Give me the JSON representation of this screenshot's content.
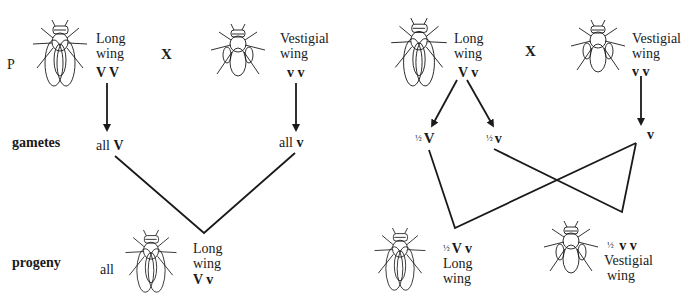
{
  "row_labels": {
    "parents": "P",
    "gametes": "gametes",
    "progeny": "progeny"
  },
  "cross_symbol": "X",
  "left_cross": {
    "parent1": {
      "phenotype_line1": "Long",
      "phenotype_line2": "wing",
      "genotype": "V V",
      "fly_icon": "long-wing-fly"
    },
    "parent2": {
      "phenotype_line1": "Vestigial",
      "phenotype_line2": "wing",
      "genotype": "v v",
      "fly_icon": "vestigial-wing-fly"
    },
    "gamete1": {
      "prefix": "all",
      "allele": "V"
    },
    "gamete2": {
      "prefix": "all",
      "allele": "v"
    },
    "progeny": {
      "prefix": "all",
      "phenotype_line1": "Long",
      "phenotype_line2": "wing",
      "genotype": "V v",
      "fly_icon": "long-wing-fly"
    }
  },
  "right_cross": {
    "parent1": {
      "phenotype_line1": "Long",
      "phenotype_line2": "wing",
      "genotype": "V v",
      "fly_icon": "long-wing-fly"
    },
    "parent2": {
      "phenotype_line1": "Vestigial",
      "phenotype_line2": "wing",
      "genotype": "v v",
      "fly_icon": "vestigial-wing-fly"
    },
    "gamete1": {
      "fraction": "½",
      "allele": "V"
    },
    "gamete2": {
      "fraction": "½",
      "allele": "v"
    },
    "gamete3": {
      "allele": "v"
    },
    "progeny1": {
      "fraction": "½",
      "genotype": "V v",
      "phenotype_line1": "Long",
      "phenotype_line2": "wing",
      "fly_icon": "long-wing-fly"
    },
    "progeny2": {
      "fraction": "½",
      "genotype": "v v",
      "phenotype_line1": "Vestigial",
      "phenotype_line2": "wing",
      "fly_icon": "vestigial-wing-fly"
    }
  },
  "colors": {
    "ink": "#1a1a1a",
    "background": "#ffffff"
  }
}
